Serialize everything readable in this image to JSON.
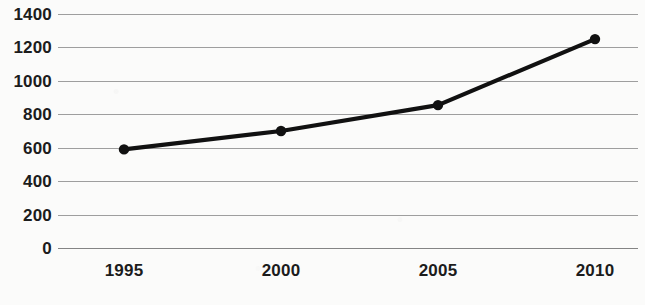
{
  "chart_data": {
    "type": "line",
    "title": "",
    "xlabel": "",
    "ylabel": "",
    "x": [
      1995,
      2000,
      2005,
      2010
    ],
    "categories": [
      "1995",
      "2000",
      "2005",
      "2010"
    ],
    "values": [
      590,
      700,
      855,
      1250
    ],
    "series": [
      {
        "name": "",
        "values": [
          590,
          700,
          855,
          1250
        ]
      }
    ],
    "ylim": [
      0,
      1400
    ],
    "yticks": [
      0,
      200,
      400,
      600,
      800,
      1000,
      1200,
      1400
    ],
    "ytick_labels": [
      "0",
      "200",
      "400",
      "600",
      "800",
      "1000",
      "1200",
      "1400"
    ],
    "xtick_labels": [
      "1995",
      "2000",
      "2005",
      "2010"
    ],
    "grid": true,
    "legend": false,
    "marker": "circle",
    "line_color": "#111111",
    "grid_color": "#8d8d8d",
    "background_color": "#fbfbfa"
  },
  "axes": {
    "y_ticks": [
      {
        "label": "1400",
        "value": 1400
      },
      {
        "label": "1200",
        "value": 1200
      },
      {
        "label": "1000",
        "value": 1000
      },
      {
        "label": "800",
        "value": 800
      },
      {
        "label": "600",
        "value": 600
      },
      {
        "label": "400",
        "value": 400
      },
      {
        "label": "200",
        "value": 200
      },
      {
        "label": "0",
        "value": 0
      }
    ],
    "x_ticks": [
      {
        "label": "1995",
        "value": 1995
      },
      {
        "label": "2000",
        "value": 2000
      },
      {
        "label": "2005",
        "value": 2005
      },
      {
        "label": "2010",
        "value": 2010
      }
    ]
  }
}
